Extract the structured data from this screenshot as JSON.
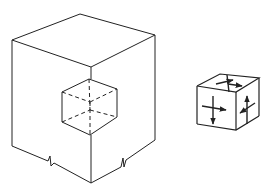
{
  "figure": {
    "colors": {
      "stroke": "#222222",
      "background": "#ffffff"
    },
    "large_cube": {
      "label": "",
      "vertices": {
        "top": [
          80,
          14
        ],
        "left": [
          12,
          40
        ],
        "right": [
          155,
          35
        ],
        "front_top": [
          91,
          67
        ],
        "bottom_left": [
          12,
          146
        ],
        "bottom_front": [
          91,
          183
        ],
        "bottom_right": [
          155,
          140
        ]
      },
      "break_marks": [
        [
          50,
          162
        ],
        [
          122,
          163
        ]
      ]
    },
    "inner_cube": {
      "vertices": {
        "top": [
          89,
          79
        ],
        "left_top": [
          62,
          92
        ],
        "right_top": [
          117,
          89
        ],
        "center": [
          90,
          102
        ],
        "left_bottom": [
          62,
          122
        ],
        "right_bottom": [
          117,
          117
        ],
        "bottom": [
          90,
          135
        ]
      }
    },
    "small_cube": {
      "arrows": [
        "top-face-cross",
        "left-face-cross",
        "right-face-cross"
      ]
    }
  }
}
